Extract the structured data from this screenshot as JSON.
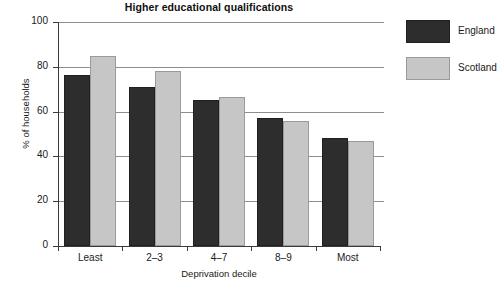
{
  "chart_data": {
    "type": "bar",
    "title": "Higher educational qualifications",
    "xlabel": "Deprivation decile",
    "ylabel": "% of households",
    "categories": [
      "Least",
      "2–3",
      "4–7",
      "8–9",
      "Most"
    ],
    "series": [
      {
        "name": "England",
        "color": "#2d2d2d",
        "values": [
          76.5,
          71,
          65,
          57,
          48
        ]
      },
      {
        "name": "Scotland",
        "color": "#c6c6c6",
        "values": [
          85,
          78,
          66.5,
          56,
          47
        ]
      }
    ],
    "ylim": [
      0,
      100
    ],
    "yticks": [
      0,
      20,
      40,
      60,
      80,
      100
    ],
    "ytick_labels": [
      "0",
      "20",
      "40",
      "60",
      "80",
      "100"
    ],
    "grid": true,
    "grid_axis": "y",
    "legend_position": "right"
  },
  "legend": {
    "items": [
      {
        "label": "England"
      },
      {
        "label": "Scotland"
      }
    ]
  }
}
